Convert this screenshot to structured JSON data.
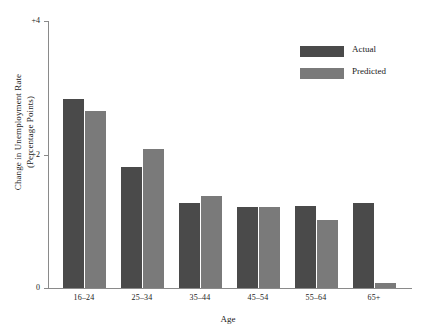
{
  "chart_data": {
    "type": "bar",
    "title": "",
    "subtitle": "",
    "xlabel": "Age",
    "ylabel": "Change in Unemployment Rate (Percentage Points)",
    "ylabel_line1": "Change in Unemployment Rate",
    "ylabel_line2": "(Percentage Points)",
    "categories": [
      "16–24",
      "25–34",
      "35–44",
      "45–54",
      "55–64",
      "65+"
    ],
    "series": [
      {
        "name": "Actual",
        "color": "#4a4a4a",
        "values": [
          2.83,
          1.82,
          1.28,
          1.22,
          1.23,
          1.28
        ]
      },
      {
        "name": "Predicted",
        "color": "#7a7a7a",
        "values": [
          2.65,
          2.08,
          1.38,
          1.22,
          1.02,
          0.08
        ]
      }
    ],
    "ylim": [
      0,
      4
    ],
    "yticks": [
      0,
      2,
      4
    ],
    "ytick_labels": [
      "0",
      "+2",
      "+4"
    ],
    "grid": false,
    "legend_position": "top-right",
    "axis_color": "#8a8a8a"
  }
}
